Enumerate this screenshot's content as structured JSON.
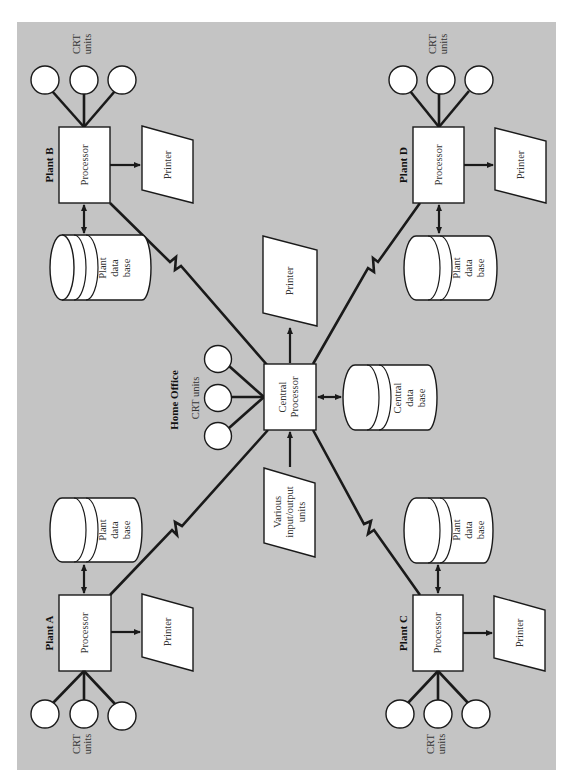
{
  "diagram": {
    "colors": {
      "panel": "#c4c4c4",
      "shape_fill": "#ffffff",
      "stroke": "#1a1a1a",
      "text": "#333333"
    },
    "home_office": {
      "label": "Home Office",
      "crt_label": "CRT units",
      "processor_line1": "Central",
      "processor_line2": "Processor",
      "printer_label": "Printer",
      "database_line1": "Central",
      "database_line2": "data",
      "database_line3": "base",
      "io_line1": "Various",
      "io_line2": "input/output",
      "io_line3": "units"
    },
    "plants": [
      {
        "id": "A",
        "label": "Plant A",
        "processor_label": "Processor",
        "printer_label": "Printer",
        "crt_line1": "CRT",
        "crt_line2": "units",
        "database_line1": "Plant",
        "database_line2": "data",
        "database_line3": "base"
      },
      {
        "id": "B",
        "label": "Plant B",
        "processor_label": "Processor",
        "printer_label": "Printer",
        "crt_line1": "CRT",
        "crt_line2": "units",
        "database_line1": "Plant",
        "database_line2": "data",
        "database_line3": "base"
      },
      {
        "id": "C",
        "label": "Plant C",
        "processor_label": "Processor",
        "printer_label": "Printer",
        "crt_line1": "CRT",
        "crt_line2": "units",
        "database_line1": "Plant",
        "database_line2": "data",
        "database_line3": "base"
      },
      {
        "id": "D",
        "label": "Plant D",
        "processor_label": "Processor",
        "printer_label": "Printer",
        "crt_line1": "CRT",
        "crt_line2": "units",
        "database_line1": "Plant",
        "database_line2": "data",
        "database_line3": "base"
      }
    ]
  }
}
